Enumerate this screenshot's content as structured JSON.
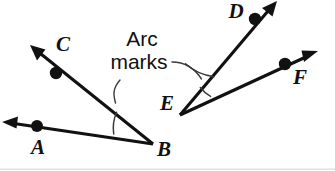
{
  "figure": {
    "background_color": "#ffffff",
    "ink_color": "#111111",
    "arc_color": "#3a3a3a",
    "width": 335,
    "height": 171
  },
  "callout": {
    "line1": "Arc",
    "line2": "marks"
  },
  "vertices": [
    {
      "id": "B",
      "label": "B",
      "x": 153,
      "y": 144,
      "label_x": 164,
      "label_y": 151
    },
    {
      "id": "E",
      "label": "E",
      "x": 180,
      "y": 115,
      "label_x": 167,
      "label_y": 105
    }
  ],
  "points": [
    {
      "id": "A",
      "label": "A",
      "dot_x": 37,
      "dot_y": 126,
      "label_x": 38,
      "label_y": 149
    },
    {
      "id": "C",
      "label": "C",
      "dot_x": 56,
      "dot_y": 73,
      "label_x": 63,
      "label_y": 46
    },
    {
      "id": "D",
      "label": "D",
      "dot_x": 255,
      "dot_y": 19,
      "label_x": 236,
      "label_y": 13
    },
    {
      "id": "F",
      "label": "F",
      "dot_x": 285,
      "dot_y": 64,
      "label_x": 300,
      "label_y": 79
    }
  ],
  "rays": [
    {
      "id": "BA",
      "from": "B",
      "through": "A",
      "x1": 153,
      "y1": 144,
      "x2": 6,
      "y2": 122
    },
    {
      "id": "BC",
      "from": "B",
      "through": "C",
      "x1": 153,
      "y1": 144,
      "x2": 34,
      "y2": 48
    },
    {
      "id": "ED",
      "from": "E",
      "through": "D",
      "x1": 180,
      "y1": 115,
      "x2": 275,
      "y2": 4
    },
    {
      "id": "EF",
      "from": "E",
      "through": "F",
      "x1": 180,
      "y1": 115,
      "x2": 317,
      "y2": 52
    }
  ],
  "arc_marks": [
    {
      "id": "arc-at-B",
      "vertex": "B",
      "radius": 40,
      "labelled": true
    },
    {
      "id": "arc-at-E-inner",
      "vertex": "E",
      "radius": 34,
      "labelled": false
    },
    {
      "id": "arc-at-E-outer",
      "vertex": "E",
      "radius": 52,
      "labelled": true
    }
  ]
}
